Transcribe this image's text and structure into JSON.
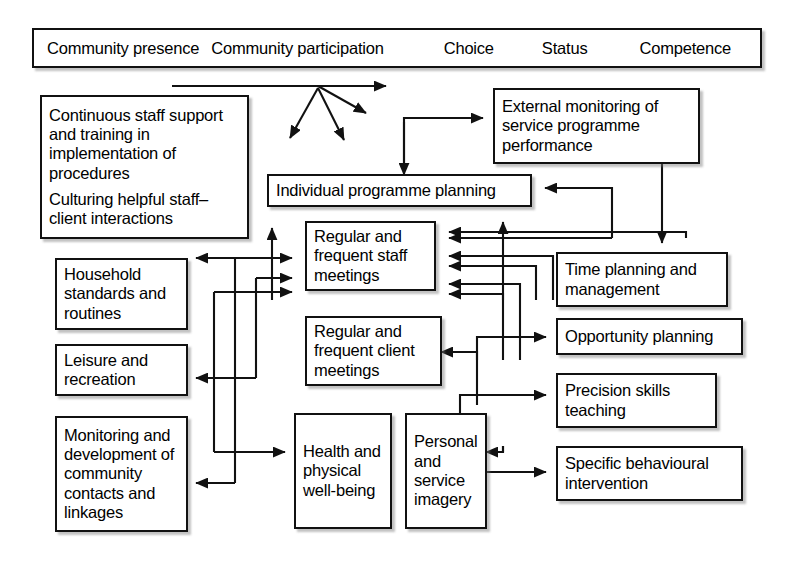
{
  "diagram": {
    "title_banner": {
      "items": [
        "Community presence",
        "Community participation",
        "Choice",
        "Status",
        "Competence"
      ]
    },
    "nodes": {
      "staff_support": {
        "line1": "Continuous staff support and training in implementation of procedures",
        "line2": "Culturing helpful staff–client interactions"
      },
      "household": "Household standards and routines",
      "leisure": "Leisure and recreation",
      "monitoring_community": "Monitoring and development of community contacts and linkages",
      "individual_planning": "Individual programme planning",
      "staff_meetings": "Regular and frequent staff meetings",
      "client_meetings": "Regular and frequent client meetings",
      "health": "Health and physical well-being",
      "imagery": "Personal and service imagery",
      "external_monitoring": "External monitoring of service programme performance",
      "time_planning": "Time planning and management",
      "opportunity_planning": "Opportunity planning",
      "precision_skills": "Precision skills teaching",
      "specific_behavioural": "Specific behavioural intervention"
    },
    "colors": {
      "line": "#111111",
      "box_border": "#111111",
      "background": "#ffffff",
      "text": "#000000"
    }
  }
}
